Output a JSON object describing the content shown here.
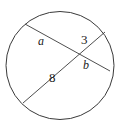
{
  "figure": {
    "name": "circle-with-two-intersecting-chords",
    "type": "geometry-diagram",
    "background_color": "#ffffff",
    "stroke_color": "#3a3a3a",
    "text_color": "#1a1a1a",
    "width": 120,
    "height": 130
  },
  "circle": {
    "center_x": 60,
    "center_y": 65.5,
    "radius": 54,
    "stroke_width": 1
  },
  "intersection": {
    "x": 79,
    "y": 54
  },
  "chords": [
    {
      "name": "chord-a-b",
      "x1": 25,
      "y1": 24,
      "x2": 110,
      "y2": 71,
      "segments": [
        "a",
        "b"
      ]
    },
    {
      "name": "chord-8-3",
      "x1": 23,
      "y1": 103,
      "x2": 105,
      "y2": 32,
      "segments": [
        "8",
        "3"
      ]
    }
  ],
  "labels": {
    "a": "a",
    "three": "3",
    "eight": "8",
    "b": "b"
  }
}
